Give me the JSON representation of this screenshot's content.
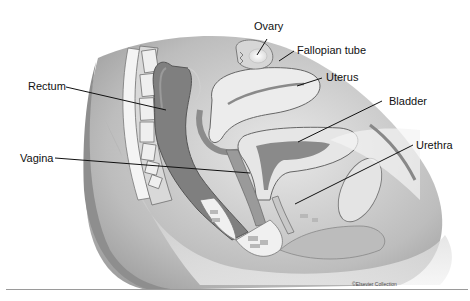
{
  "figure": {
    "labels": [
      {
        "id": "ovary",
        "text": "Ovary"
      },
      {
        "id": "fallopian-tube",
        "text": "Fallopian tube"
      },
      {
        "id": "uterus",
        "text": "Uterus"
      },
      {
        "id": "bladder",
        "text": "Bladder"
      },
      {
        "id": "rectum",
        "text": "Rectum"
      },
      {
        "id": "vagina",
        "text": "Vagina"
      },
      {
        "id": "urethra",
        "text": "Urethra"
      }
    ],
    "credit": "©Elsevier Collection"
  }
}
